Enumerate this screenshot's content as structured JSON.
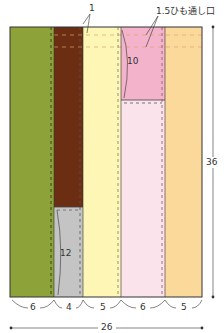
{
  "diagram": {
    "type": "sewing-pattern-panel",
    "annotations": {
      "top_seam": "1",
      "drawstring_opening": "1.5ひも通し口",
      "pink_section_height": "10",
      "gray_section_height": "12",
      "total_height": "36",
      "total_width": "26"
    },
    "column_widths": [
      "6",
      "4",
      "5",
      "6",
      "5"
    ],
    "colors": {
      "green": "#8da33a",
      "brown": "#6b2e12",
      "gray": "#c4c4c4",
      "yellow": "#fdf6b4",
      "pink": "#f2b3cb",
      "light_pink": "#fbe3ec",
      "orange": "#fbd99a",
      "outline": "#333333",
      "dash": "#555555",
      "orange_dash": "#e0a070"
    }
  }
}
